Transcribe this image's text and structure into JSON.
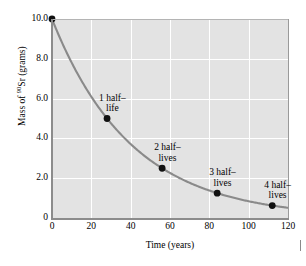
{
  "chart_data": {
    "type": "line",
    "title": "",
    "xlabel": "Time (years)",
    "ylabel_html": "Mass of <sup>90</sup>Sr (grams)",
    "ylabel_text": "Mass of 90Sr (grams)",
    "ylabel_prefix": "Mass of ",
    "ylabel_superscript": "90",
    "ylabel_suffix": "Sr (grams)",
    "xlim": [
      0,
      120
    ],
    "ylim": [
      0,
      10
    ],
    "grid": true,
    "legend": "none",
    "xticks": [
      {
        "value": 0,
        "label": "0"
      },
      {
        "value": 20,
        "label": "20"
      },
      {
        "value": 40,
        "label": "40"
      },
      {
        "value": 60,
        "label": "60"
      },
      {
        "value": 80,
        "label": "80"
      },
      {
        "value": 100,
        "label": "100"
      },
      {
        "value": 120,
        "label": "120"
      }
    ],
    "yticks": [
      {
        "value": 0,
        "label": "0"
      },
      {
        "value": 2,
        "label": "2.0"
      },
      {
        "value": 4,
        "label": "4.0"
      },
      {
        "value": 6,
        "label": "6.0"
      },
      {
        "value": 8,
        "label": "8.0"
      },
      {
        "value": 10,
        "label": "10.0"
      }
    ],
    "series": [
      {
        "name": "Sr-90 decay",
        "half_life_years": 28,
        "initial_mass_grams": 10.0,
        "curve_color": "#8a8a8a",
        "marker_color": "#111111",
        "x": [
          0,
          28,
          56,
          84,
          112
        ],
        "values": [
          10.0,
          5.0,
          2.5,
          1.25,
          0.625
        ]
      }
    ],
    "annotations": [
      {
        "x": 0,
        "y": 10.0,
        "label_line1": "",
        "label_line2": ""
      },
      {
        "x": 28,
        "y": 5.0,
        "label_line1": "1 half–",
        "label_line2": "life"
      },
      {
        "x": 56,
        "y": 2.5,
        "label_line1": "2 half–",
        "label_line2": "lives"
      },
      {
        "x": 84,
        "y": 1.25,
        "label_line1": "3 half–",
        "label_line2": "lives"
      },
      {
        "x": 112,
        "y": 0.625,
        "label_line1": "4 half–",
        "label_line2": "lives"
      }
    ],
    "colors": {
      "plot_background": "#e3e3e3",
      "gridline": "#ffffff",
      "axis": "#8c8c8c",
      "curve": "#8a8a8a",
      "marker": "#111111",
      "page_background": "#ffffff",
      "text": "#000000"
    }
  }
}
